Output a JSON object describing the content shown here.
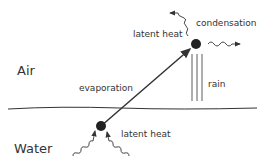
{
  "labels": {
    "air": "Air",
    "water": "Water",
    "evaporation": "evaporation",
    "condensation": "condensation",
    "latent_heat_top": "latent heat",
    "latent_heat_bottom": "latent heat",
    "rain": "rain"
  },
  "colors": {
    "stroke": "#333333",
    "text": "#333333"
  }
}
